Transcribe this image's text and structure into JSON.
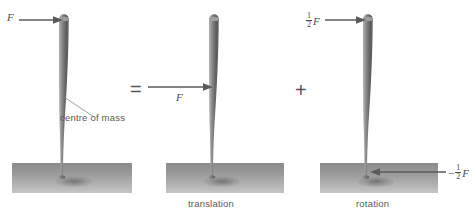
{
  "figure": {
    "background_color": "#ffffff",
    "bat_color": "#6e6e6e",
    "slab_color": "#9a9a9a",
    "annotation_color": "#4a4a4a"
  },
  "panels": [
    {
      "id": "applied-force",
      "caption": "",
      "force_label": "F",
      "com_label": "centre of mass"
    },
    {
      "id": "translation",
      "caption": "translation",
      "force_label": "F"
    },
    {
      "id": "rotation",
      "caption": "rotation",
      "force_top_sign": "",
      "force_top_numerator": "1",
      "force_top_denominator": "2",
      "force_top_variable": "F",
      "force_bottom_sign": "−",
      "force_bottom_numerator": "1",
      "force_bottom_denominator": "2",
      "force_bottom_variable": "F"
    }
  ],
  "operators": {
    "equals": "=",
    "plus": "+"
  }
}
